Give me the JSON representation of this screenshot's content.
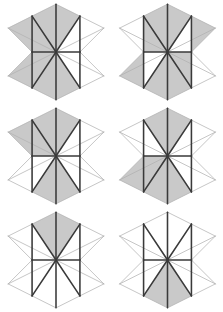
{
  "page": {
    "background_color": "#ffffff",
    "width": 223,
    "height": 312
  },
  "style": {
    "shaded_fill": "#c9c9c9",
    "unshaded_fill": "#ffffff",
    "heavy_stroke": "#3a3a3a",
    "light_stroke": "#b0b0b0",
    "heavy_width": 1.5,
    "light_width": 0.7
  },
  "geometry": {
    "note": "Hexagon vertices in local 100x100 viewbox coordinates.",
    "center": [
      50,
      50
    ],
    "top": [
      50,
      4
    ],
    "bottom": [
      50,
      96
    ],
    "left_upper": [
      4,
      27
    ],
    "left_lower": [
      4,
      73
    ],
    "right_upper": [
      96,
      27
    ],
    "right_lower": [
      96,
      73
    ],
    "mid_left": [
      27,
      50
    ],
    "mid_right": [
      73,
      50
    ],
    "mid_top_left": [
      27,
      15.5
    ],
    "mid_top_right": [
      73,
      15.5
    ],
    "mid_bottom_left": [
      27,
      84.5
    ],
    "mid_bottom_right": [
      73,
      84.5
    ],
    "triangle_ids": [
      "t1",
      "t2",
      "t3",
      "t4",
      "t5",
      "t6",
      "t7",
      "t8",
      "t9",
      "t10",
      "t11",
      "t12"
    ]
  },
  "figures": [
    {
      "id": "figure-1",
      "position": "top-left",
      "shaded_count": 8,
      "shaded": [
        "t1",
        "t2",
        "t3",
        "t4",
        "t7",
        "t8",
        "t9",
        "t10"
      ],
      "unshaded": [
        "t5",
        "t6",
        "t11",
        "t12"
      ]
    },
    {
      "id": "figure-2",
      "position": "top-right",
      "shaded_count": 8,
      "shaded": [
        "t2",
        "t3",
        "t4",
        "t5",
        "t8",
        "t9",
        "t10",
        "t11"
      ],
      "unshaded": [
        "t1",
        "t6",
        "t7",
        "t12"
      ]
    },
    {
      "id": "figure-3",
      "position": "middle-left",
      "shaded_count": 6,
      "shaded": [
        "t1",
        "t2",
        "t3",
        "t4",
        "t9",
        "t10"
      ],
      "unshaded": [
        "t5",
        "t6",
        "t7",
        "t8",
        "t11",
        "t12"
      ]
    },
    {
      "id": "figure-4",
      "position": "middle-right",
      "shaded_count": 6,
      "shaded": [
        "t3",
        "t4",
        "t7",
        "t8",
        "t9",
        "t10"
      ],
      "unshaded": [
        "t1",
        "t2",
        "t5",
        "t6",
        "t11",
        "t12"
      ]
    },
    {
      "id": "figure-5",
      "position": "bottom-left",
      "shaded_count": 2,
      "shaded": [
        "t3",
        "t4"
      ],
      "unshaded": [
        "t1",
        "t2",
        "t5",
        "t6",
        "t7",
        "t8",
        "t9",
        "t10",
        "t11",
        "t12"
      ]
    },
    {
      "id": "figure-6",
      "position": "bottom-right",
      "shaded_count": 2,
      "shaded": [
        "t9",
        "t10"
      ],
      "unshaded": [
        "t1",
        "t2",
        "t3",
        "t4",
        "t5",
        "t6",
        "t7",
        "t8",
        "t11",
        "t12"
      ]
    }
  ]
}
